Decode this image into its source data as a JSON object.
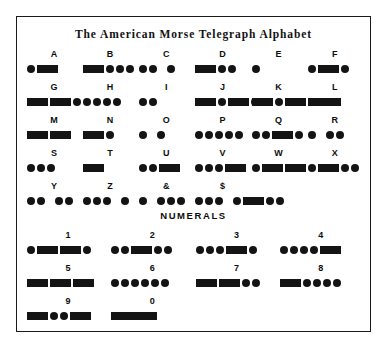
{
  "title": "The American Morse Telegraph Alphabet",
  "numerals_header": "NUMERALS",
  "colors": {
    "ink": "#141414",
    "frame": "#1a1a1a",
    "background": "#ffffff"
  },
  "alphabet_rows": [
    [
      {
        "label": "A",
        "code": [
          "dot",
          "dash1"
        ]
      },
      {
        "label": "B",
        "code": [
          "dash1",
          "dot",
          "dot",
          "dot"
        ]
      },
      {
        "label": "C",
        "code": [
          "dot",
          "dot",
          "gap",
          "dot"
        ]
      },
      {
        "label": "D",
        "code": [
          "dash1",
          "dot",
          "dot"
        ]
      },
      {
        "label": "E",
        "code": [
          "dot"
        ]
      },
      {
        "label": "F",
        "code": [
          "dot",
          "dash1",
          "dot"
        ]
      }
    ],
    [
      {
        "label": "G",
        "code": [
          "dash1",
          "dash1",
          "dot"
        ]
      },
      {
        "label": "H",
        "code": [
          "dot",
          "dot",
          "dot",
          "dot"
        ]
      },
      {
        "label": "I",
        "code": [
          "dot",
          "dot"
        ]
      },
      {
        "label": "J",
        "code": [
          "dash1",
          "dot",
          "dash1",
          "dot"
        ]
      },
      {
        "label": "K",
        "code": [
          "dash1",
          "dot",
          "dash1"
        ]
      },
      {
        "label": "L",
        "code": [
          "dash2"
        ]
      }
    ],
    [
      {
        "label": "M",
        "code": [
          "dash1",
          "dash1"
        ]
      },
      {
        "label": "N",
        "code": [
          "dash1",
          "dot"
        ]
      },
      {
        "label": "O",
        "code": [
          "dot",
          "gap",
          "dot"
        ]
      },
      {
        "label": "P",
        "code": [
          "dot",
          "dot",
          "dot",
          "dot",
          "dot"
        ]
      },
      {
        "label": "Q",
        "code": [
          "dot",
          "dot",
          "dash1",
          "dot"
        ]
      },
      {
        "label": "R",
        "code": [
          "dot",
          "gap",
          "dot",
          "dot"
        ]
      }
    ],
    [
      {
        "label": "S",
        "code": [
          "dot",
          "dot",
          "dot"
        ]
      },
      {
        "label": "T",
        "code": [
          "dash1"
        ]
      },
      {
        "label": "U",
        "code": [
          "dot",
          "dot",
          "dash1"
        ]
      },
      {
        "label": "V",
        "code": [
          "dot",
          "dot",
          "dot",
          "dash1"
        ]
      },
      {
        "label": "W",
        "code": [
          "dot",
          "dash1",
          "dash1"
        ]
      },
      {
        "label": "X",
        "code": [
          "dot",
          "dash1",
          "dot",
          "dot"
        ]
      }
    ],
    [
      {
        "label": "Y",
        "code": [
          "dot",
          "dot",
          "gap",
          "dot",
          "dot"
        ]
      },
      {
        "label": "Z",
        "code": [
          "dot",
          "dot",
          "dot",
          "gap",
          "dot"
        ]
      },
      {
        "label": "&",
        "code": [
          "dot",
          "gap",
          "dot",
          "dot",
          "dot"
        ]
      },
      {
        "label": "$",
        "code": [
          "dot",
          "dot",
          "dot",
          "gap",
          "dot",
          "dash1",
          "dot",
          "dot"
        ]
      }
    ]
  ],
  "numeral_rows": [
    [
      {
        "label": "1",
        "code": [
          "dot",
          "dash1",
          "dash1",
          "dot"
        ]
      },
      {
        "label": "2",
        "code": [
          "dot",
          "dot",
          "dash1",
          "dot",
          "dot"
        ]
      },
      {
        "label": "3",
        "code": [
          "dot",
          "dot",
          "dot",
          "dash1",
          "dot"
        ]
      },
      {
        "label": "4",
        "code": [
          "dot",
          "dot",
          "dot",
          "dot",
          "dash1"
        ]
      }
    ],
    [
      {
        "label": "5",
        "code": [
          "dash1",
          "dash1",
          "dash1"
        ]
      },
      {
        "label": "6",
        "code": [
          "dot",
          "dot",
          "dot",
          "dot",
          "dot",
          "dot"
        ]
      },
      {
        "label": "7",
        "code": [
          "dash1",
          "dash1",
          "dot",
          "dot"
        ]
      },
      {
        "label": "8",
        "code": [
          "dash1",
          "dot",
          "dot",
          "dot",
          "dot"
        ]
      }
    ],
    [
      {
        "label": "9",
        "code": [
          "dash1",
          "dot",
          "dot",
          "dash1"
        ]
      },
      {
        "label": "0",
        "code": [
          "dash3"
        ]
      }
    ]
  ]
}
